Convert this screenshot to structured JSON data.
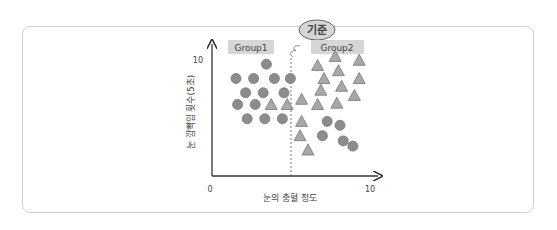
{
  "chart_data": {
    "type": "scatter",
    "title": "",
    "xlabel": "눈의 충혈 정도",
    "ylabel": "눈 깜빡임 횟수(5초)",
    "xlim": [
      0,
      10
    ],
    "ylim": [
      0,
      10
    ],
    "x_ticks": [
      "0",
      "10"
    ],
    "y_ticks": [
      "10"
    ],
    "grid": false,
    "divider": {
      "label": "기준",
      "x": 5,
      "style": "dashed"
    },
    "groups": [
      {
        "label": "Group1",
        "region": "left"
      },
      {
        "label": "Group2",
        "region": "right"
      }
    ],
    "series": [
      {
        "name": "circle",
        "marker": "circle",
        "color": "#8c8c8c",
        "points": [
          [
            3.4,
            8.6
          ],
          [
            1.5,
            7.5
          ],
          [
            2.6,
            7.5
          ],
          [
            3.9,
            7.5
          ],
          [
            4.9,
            7.5
          ],
          [
            2.1,
            6.4
          ],
          [
            3.2,
            6.4
          ],
          [
            4.5,
            6.4
          ],
          [
            1.6,
            5.5
          ],
          [
            2.7,
            5.5
          ],
          [
            2.2,
            4.4
          ],
          [
            3.3,
            4.4
          ],
          [
            4.4,
            4.4
          ],
          [
            7.2,
            4.2
          ],
          [
            8.0,
            3.9
          ],
          [
            6.9,
            3.1
          ],
          [
            8.2,
            2.7
          ],
          [
            8.8,
            2.3
          ]
        ]
      },
      {
        "name": "triangle",
        "marker": "triangle",
        "color": "#a8a8a8",
        "points": [
          [
            3.7,
            5.5
          ],
          [
            4.7,
            5.5
          ],
          [
            7.7,
            9.2
          ],
          [
            9.2,
            8.9
          ],
          [
            6.6,
            8.5
          ],
          [
            7.9,
            8.1
          ],
          [
            7.0,
            7.5
          ],
          [
            9.2,
            7.5
          ],
          [
            6.8,
            6.6
          ],
          [
            8.1,
            6.9
          ],
          [
            8.9,
            6.2
          ],
          [
            5.6,
            5.9
          ],
          [
            6.6,
            5.5
          ],
          [
            7.8,
            5.6
          ],
          [
            5.6,
            4.2
          ],
          [
            5.5,
            3.1
          ],
          [
            6.0,
            2.0
          ]
        ]
      }
    ]
  }
}
